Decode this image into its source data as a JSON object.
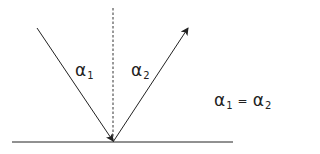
{
  "diagram": {
    "labels": {
      "incident_angle": {
        "symbol": "α",
        "subscript": "1"
      },
      "reflected_angle": {
        "symbol": "α",
        "subscript": "2"
      },
      "equation": {
        "left_symbol": "α",
        "left_subscript": "1",
        "operator": "=",
        "right_symbol": "α",
        "right_subscript": "2"
      }
    },
    "elements": {
      "surface": {
        "x1": 12,
        "y1": 142,
        "x2": 233,
        "y2": 142
      },
      "normal": {
        "x1": 113,
        "y1": 8,
        "x2": 113,
        "y2": 142,
        "style": "dashed"
      },
      "incident_ray": {
        "x1": 37,
        "y1": 28,
        "x2": 113,
        "y2": 142
      },
      "reflected_ray": {
        "x1": 113,
        "y1": 142,
        "x2": 188,
        "y2": 27
      }
    },
    "colors": {
      "stroke": "#222222",
      "background": "#ffffff"
    }
  }
}
